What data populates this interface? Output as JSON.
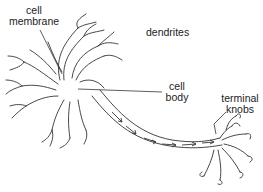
{
  "diagram": {
    "type": "labeled-illustration",
    "labels": {
      "cell_membrane": {
        "line1": "cell",
        "line2": "membrane"
      },
      "dendrites": "dendrites",
      "cell_body": {
        "line1": "cell",
        "line2": "body"
      },
      "terminal_knobs": {
        "line1": "terminal",
        "line2": "knobs"
      }
    },
    "colors": {
      "stroke": "#333333",
      "background": "#ffffff",
      "text": "#222222"
    },
    "signal_direction": "cell body to terminal knobs along axon"
  }
}
